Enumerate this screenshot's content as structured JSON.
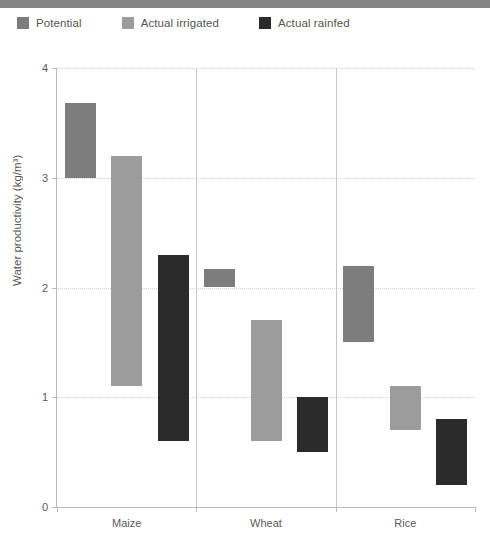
{
  "figure": {
    "top_rule_color": "#858585"
  },
  "legend": {
    "position": "top-left",
    "items": [
      {
        "label": "Potential",
        "color": "#7d7d7d"
      },
      {
        "label": "Actual irrigated",
        "color": "#9c9c9c"
      },
      {
        "label": "Actual rainfed",
        "color": "#2b2b2b"
      }
    ]
  },
  "chart_data": {
    "type": "bar",
    "subtype": "floating-range-bar",
    "title": "",
    "xlabel": "",
    "ylabel": "Water productivity (kg/m³)",
    "ylim": [
      0,
      4
    ],
    "yticks": [
      0,
      1,
      2,
      3,
      4
    ],
    "ytick_labels": [
      "0",
      "1",
      "2",
      "3",
      "4"
    ],
    "grid": "horizontal-dotted",
    "categories": [
      "Maize",
      "Wheat",
      "Rice"
    ],
    "series": [
      {
        "name": "Potential",
        "color": "#7d7d7d",
        "ranges": [
          {
            "category": "Maize",
            "low": 3.0,
            "high": 3.68
          },
          {
            "category": "Wheat",
            "low": 2.0,
            "high": 2.17
          },
          {
            "category": "Rice",
            "low": 1.5,
            "high": 2.2
          }
        ]
      },
      {
        "name": "Actual irrigated",
        "color": "#9c9c9c",
        "ranges": [
          {
            "category": "Maize",
            "low": 1.1,
            "high": 3.2
          },
          {
            "category": "Wheat",
            "low": 0.6,
            "high": 1.7
          },
          {
            "category": "Rice",
            "low": 0.7,
            "high": 1.1
          }
        ]
      },
      {
        "name": "Actual rainfed",
        "color": "#2b2b2b",
        "ranges": [
          {
            "category": "Maize",
            "low": 0.6,
            "high": 2.3
          },
          {
            "category": "Wheat",
            "low": 0.5,
            "high": 1.0
          },
          {
            "category": "Rice",
            "low": 0.2,
            "high": 0.8
          }
        ]
      }
    ]
  }
}
